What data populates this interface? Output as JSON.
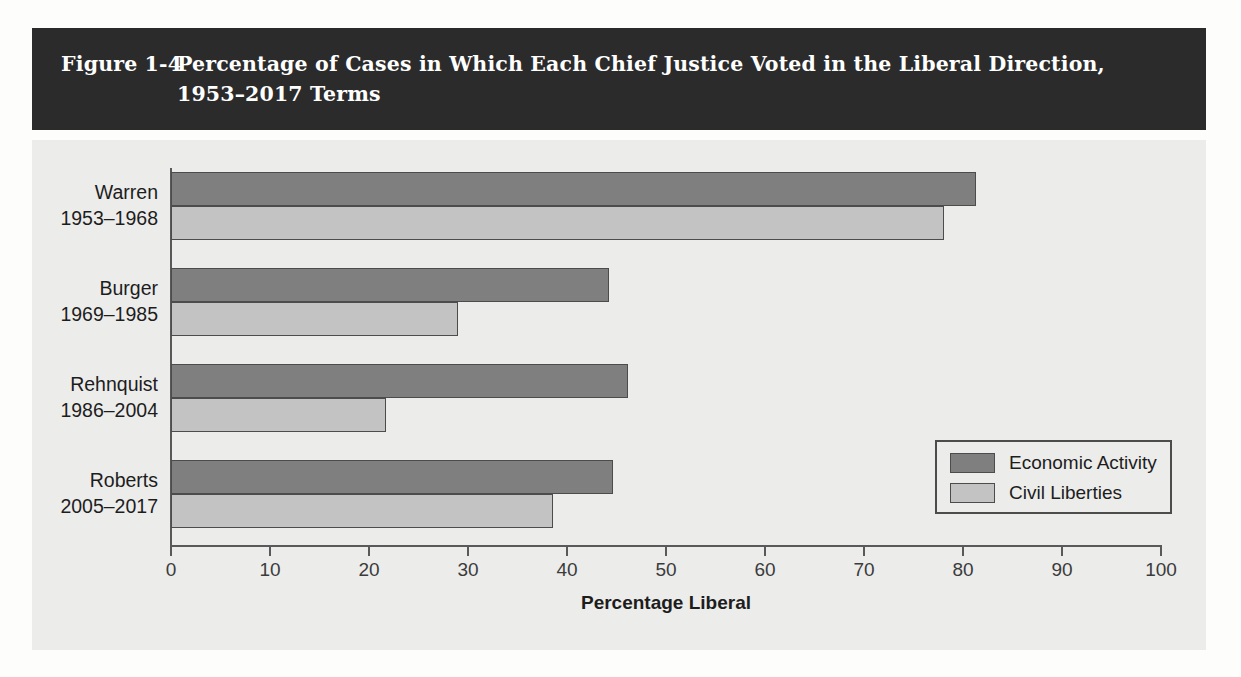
{
  "figure": {
    "number": "Figure 1-4",
    "caption_line1": "Percentage of Cases in Which Each Chief Justice Voted in the Liberal Direction,",
    "caption_line2": "1953–2017 Terms"
  },
  "colors": {
    "banner_background": "#2b2b2b",
    "banner_text": "#ffffff",
    "panel_background": "#ececeb",
    "economic_activity": "#7f7f7f",
    "civil_liberties": "#c3c3c3",
    "bar_outline": "#4c4c4c",
    "axis": "#59595a"
  },
  "chart_data": {
    "type": "bar",
    "orientation": "horizontal",
    "title": "Percentage of Cases in Which Each Chief Justice Voted in the Liberal Direction, 1953–2017 Terms",
    "xlabel": "Percentage Liberal",
    "ylabel": "",
    "xlim": [
      0,
      100
    ],
    "xticks": [
      0,
      10,
      20,
      30,
      40,
      50,
      60,
      70,
      80,
      90,
      100
    ],
    "xtick_labels": [
      "0",
      "10",
      "20",
      "30",
      "40",
      "50",
      "60",
      "70",
      "80",
      "90",
      "100"
    ],
    "grid": false,
    "legend_position": "center right",
    "categories": [
      "Warren",
      "Burger",
      "Rehnquist",
      "Roberts"
    ],
    "category_labels": [
      {
        "name": "Warren",
        "years": "1953–1968"
      },
      {
        "name": "Burger",
        "years": "1969–1985"
      },
      {
        "name": "Rehnquist",
        "years": "1986–2004"
      },
      {
        "name": "Roberts",
        "years": "2005–2017"
      }
    ],
    "series": [
      {
        "name": "Economic Activity",
        "color": "#7f7f7f",
        "values": [
          81.3,
          44.2,
          46.2,
          44.6
        ]
      },
      {
        "name": "Civil Liberties",
        "color": "#c3c3c3",
        "values": [
          78.1,
          29.0,
          21.7,
          38.6
        ]
      }
    ]
  }
}
